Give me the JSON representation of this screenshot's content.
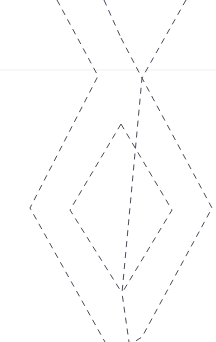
{
  "figure": {
    "title": "",
    "width": 216,
    "height": 342,
    "background_color": "#ffffff",
    "stroke_color": "#4a4a5a",
    "stroke_width": 1,
    "dash_pattern": "6 5",
    "axis_line_color": "#f0f0f2"
  },
  "chart_data": {
    "type": "line",
    "title": "",
    "xlabel": "",
    "ylabel": "",
    "grid": false,
    "legend": "none",
    "xlim": [
      0,
      216
    ],
    "ylim": [
      0,
      342
    ],
    "annotations": [],
    "tick_labels_x": [],
    "tick_labels_y": [],
    "series": [
      {
        "name": "outer-diamond-left-chain",
        "style": "dashed",
        "points": [
          [
            57,
            0
          ],
          [
            98,
            76
          ],
          [
            30,
            208
          ],
          [
            105,
            342
          ]
        ]
      },
      {
        "name": "outer-diamond-right-chain",
        "style": "dashed",
        "points": [
          [
            186,
            0
          ],
          [
            142,
            78
          ],
          [
            212,
            208
          ],
          [
            142,
            337
          ],
          [
            134,
            342
          ]
        ]
      },
      {
        "name": "upper-vee-left-arm",
        "style": "dashed",
        "points": [
          [
            104,
            0
          ],
          [
            121,
            38
          ]
        ]
      },
      {
        "name": "upper-vee-right-chain",
        "style": "dashed",
        "points": [
          [
            121,
            38
          ],
          [
            142,
            78
          ],
          [
            122,
            293
          ],
          [
            129,
            342
          ]
        ]
      },
      {
        "name": "inner-diamond-left",
        "style": "dashed",
        "points": [
          [
            121,
            124
          ],
          [
            70,
            210
          ],
          [
            122,
            293
          ]
        ]
      },
      {
        "name": "inner-diamond-right",
        "style": "dashed",
        "points": [
          [
            121,
            124
          ],
          [
            172,
            210
          ],
          [
            122,
            293
          ]
        ]
      }
    ],
    "horizontal_rule": {
      "name": "baseline-rule",
      "y": 70,
      "x_start": 0,
      "x_end": 216,
      "color": "#f0f0f2"
    }
  }
}
